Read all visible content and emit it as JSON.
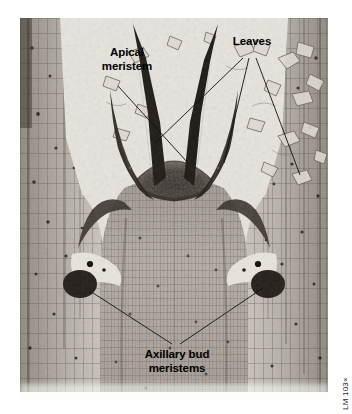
{
  "figure": {
    "kind": "light-micrograph",
    "plate_background": "#e9e7e2",
    "tissue_dark": "#1d1a17",
    "tissue_mid": "#8d867c",
    "tissue_light": "#cfc9c0"
  },
  "labels": {
    "apical_meristem": "Apical\nmeristem",
    "apical_meristem_line1": "Apical",
    "apical_meristem_line2": "meristem",
    "leaves": "Leaves",
    "axillary_line1": "Axillary bud",
    "axillary_line2": "meristems"
  },
  "caption": {
    "magnification": "LM 103×"
  },
  "leader_lines": [
    {
      "name": "apical-meristem-leader",
      "from": [
        118,
        86
      ],
      "to": [
        188,
        163
      ]
    },
    {
      "name": "leaves-leader-left",
      "from": [
        243,
        58
      ],
      "to": [
        155,
        143
      ]
    },
    {
      "name": "leaves-leader-center",
      "from": [
        249,
        58
      ],
      "to": [
        224,
        163
      ]
    },
    {
      "name": "leaves-leader-right",
      "from": [
        256,
        58
      ],
      "to": [
        300,
        175
      ]
    },
    {
      "name": "axillary-leader-left",
      "from": [
        172,
        344
      ],
      "to": [
        90,
        291
      ]
    },
    {
      "name": "axillary-leader-right",
      "from": [
        180,
        344
      ],
      "to": [
        263,
        288
      ]
    }
  ]
}
